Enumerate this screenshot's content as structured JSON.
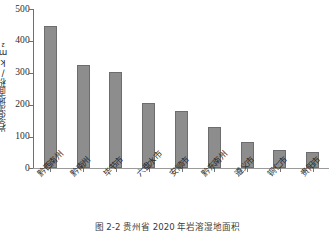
{
  "chart_data": {
    "type": "bar",
    "title": "",
    "xlabel": "",
    "ylabel": "岩溶湿地面积/km²",
    "ylim": [
      0,
      500
    ],
    "yticks": [
      0,
      100,
      200,
      300,
      400,
      500
    ],
    "grid": false,
    "legend": null,
    "categories": [
      "黔西南州",
      "黔南州",
      "毕节市",
      "六盘水市",
      "安顺市",
      "黔东南州",
      "遵义市",
      "铜仁市",
      "贵阳市"
    ],
    "values": [
      448,
      325,
      302,
      203,
      178,
      130,
      83,
      57,
      49
    ],
    "bar_color": "#8d8d8d",
    "bar_edge_color": "#6d6d6d",
    "axis_color": "#6f6f6f"
  },
  "figure": {
    "caption": "图 2-2  贵州省 2020 年岩溶湿地面积"
  }
}
